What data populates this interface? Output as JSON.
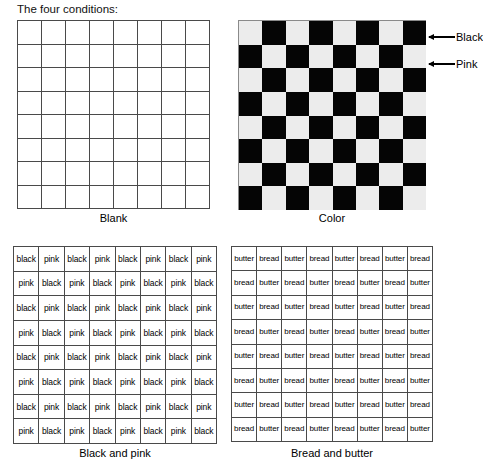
{
  "heading": "The four conditions:",
  "panels": [
    {
      "key": "blank",
      "caption": "Blank",
      "type": "empty-grid",
      "rows": 8,
      "cols": 8
    },
    {
      "key": "color",
      "caption": "Color",
      "type": "checkerboard",
      "rows": 8,
      "cols": 8,
      "first_cell": "light",
      "colors": {
        "dark": "#050505",
        "light": "#ececec"
      }
    },
    {
      "key": "blackpink",
      "caption": "Black and pink",
      "type": "word-grid",
      "rows": 8,
      "cols": 8,
      "words": [
        "black",
        "pink"
      ]
    },
    {
      "key": "breadbutter",
      "caption": "Bread and butter",
      "type": "word-grid",
      "rows": 8,
      "cols": 8,
      "words": [
        "butter",
        "bread"
      ]
    }
  ],
  "annotations": [
    {
      "key": "black",
      "label": "Black",
      "icon": "arrow-left-icon",
      "target": "color-grid-dark-square"
    },
    {
      "key": "pink",
      "label": "Pink",
      "icon": "arrow-left-icon",
      "target": "color-grid-light-square"
    }
  ]
}
